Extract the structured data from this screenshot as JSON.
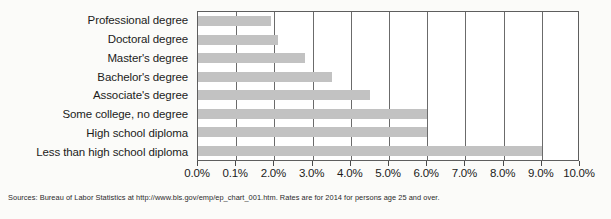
{
  "chart_data": {
    "type": "bar",
    "orientation": "horizontal",
    "title": "",
    "xlabel": "",
    "ylabel": "",
    "categories": [
      "Professional degree",
      "Doctoral degree",
      "Master's degree",
      "Bachelor's degree",
      "Associate's degree",
      "Some college, no degree",
      "High school diploma",
      "Less than high school diploma"
    ],
    "values": [
      1.9,
      2.1,
      2.8,
      3.5,
      4.5,
      6.0,
      6.0,
      9.0
    ],
    "value_unit": "%",
    "xlim": [
      0,
      10
    ],
    "tick_values": [
      0,
      1,
      2,
      3,
      4,
      5,
      6,
      7,
      8,
      9,
      10
    ],
    "tick_labels": [
      "0.0%",
      "0.1%",
      "2.0%",
      "3.0%",
      "4.0%",
      "5.0%",
      "6.0%",
      "7.0%",
      "8.0%",
      "9.0%",
      "10.0%"
    ],
    "grid": true,
    "legend": null,
    "bar_color": "#c2c2c2",
    "plot_border_color": "#5e5e5e",
    "background_color": "#fbfbf9"
  },
  "source": {
    "note": "Sources: Bureau of Labor Statistics at http://www.bls.gov/emp/ep_chart_001.htm. Rates are for 2014 for persons age 25 and over."
  }
}
